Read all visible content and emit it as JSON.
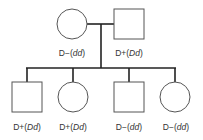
{
  "diagram": {
    "type": "pedigree",
    "colors": {
      "stroke": "#222222",
      "shape_stroke": "#555555",
      "fill": "#ffffff",
      "text": "#333333"
    },
    "parents": [
      {
        "id": "mother",
        "sex": "female",
        "shape": "circle",
        "phenotype": "D−",
        "genotype": "dd"
      },
      {
        "id": "father",
        "sex": "male",
        "shape": "square",
        "phenotype": "D+",
        "genotype": "Dd"
      }
    ],
    "children": [
      {
        "id": "child1",
        "sex": "male",
        "shape": "square",
        "phenotype": "D+",
        "genotype": "Dd"
      },
      {
        "id": "child2",
        "sex": "female",
        "shape": "circle",
        "phenotype": "D+",
        "genotype": "Dd"
      },
      {
        "id": "child3",
        "sex": "male",
        "shape": "square",
        "phenotype": "D−",
        "genotype": "dd"
      },
      {
        "id": "child4",
        "sex": "female",
        "shape": "circle",
        "phenotype": "D−",
        "genotype": "dd"
      }
    ]
  },
  "labels": {
    "mother": {
      "phen": "D−",
      "geno": "dd"
    },
    "father": {
      "phen": "D+",
      "geno": "Dd"
    },
    "child1": {
      "phen": "D+",
      "geno": "Dd"
    },
    "child2": {
      "phen": "D+",
      "geno": "Dd"
    },
    "child3": {
      "phen": "D−",
      "geno": "dd"
    },
    "child4": {
      "phen": "D−",
      "geno": "dd"
    }
  }
}
